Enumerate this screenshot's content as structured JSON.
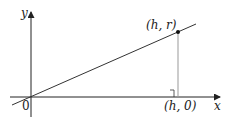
{
  "diagram": {
    "axes": {
      "x_label": "x",
      "y_label": "y",
      "origin_label": "0"
    },
    "point_label": "(h, r)",
    "foot_label": "(h, 0)",
    "colors": {
      "axis": "#222222",
      "line": "#333333",
      "vertical": "#999999"
    }
  }
}
